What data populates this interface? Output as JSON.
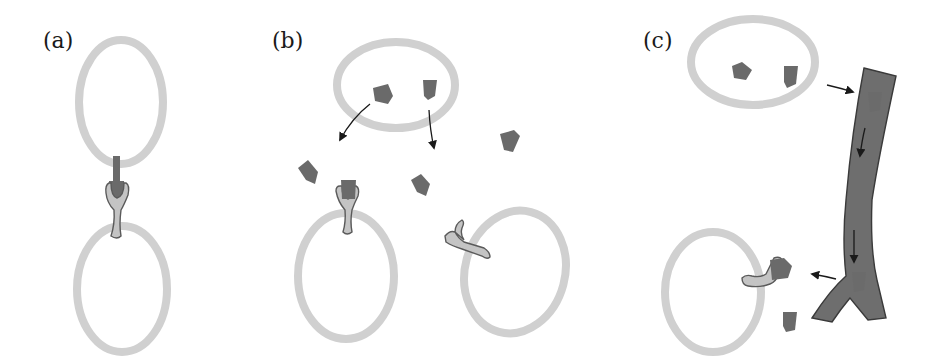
{
  "figure": {
    "panels": [
      {
        "id": "a",
        "label": "(a)",
        "mode": "contact-dependent signaling"
      },
      {
        "id": "b",
        "label": "(b)",
        "mode": "paracrine signaling"
      },
      {
        "id": "c",
        "label": "(c)",
        "mode": "endocrine signaling via bloodstream"
      }
    ],
    "colors": {
      "cell_membrane": "#d0d0d0",
      "signal_molecule": "#6a6a6a",
      "receptor": "#c4c4c4",
      "blood_vessel": "#6e6e6e",
      "arrow": "#1a1a1a"
    }
  }
}
